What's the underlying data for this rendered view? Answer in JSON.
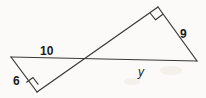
{
  "figure": {
    "type": "geometry-diagram",
    "background_color": "#fbfaf8",
    "stroke_color": "#3a3a3a",
    "text_color": "#1b1b1b",
    "canvas": {
      "width": 206,
      "height": 98
    },
    "points": {
      "left_apex": {
        "x": 11,
        "y": 57
      },
      "left_right_angle": {
        "x": 37,
        "y": 92
      },
      "crossing": {
        "x": 88,
        "y": 60
      },
      "top_right_angle": {
        "x": 158,
        "y": 7
      },
      "right_vertex": {
        "x": 197,
        "y": 61
      }
    },
    "segments": [
      {
        "name": "horizontal-base",
        "from": "left_apex",
        "to": "right_vertex"
      },
      {
        "name": "diagonal-hypotenuse",
        "from": "left_right_angle",
        "to": "top_right_angle"
      },
      {
        "name": "left-leg-6",
        "from": "left_apex",
        "to": "left_right_angle"
      },
      {
        "name": "right-leg-9",
        "from": "top_right_angle",
        "to": "right_vertex"
      }
    ],
    "right_angle_markers": [
      {
        "name": "left-triangle-right-angle",
        "at": "left_right_angle"
      },
      {
        "name": "right-triangle-right-angle",
        "at": "top_right_angle"
      }
    ],
    "labels": {
      "top_side": "10",
      "left_side": "6",
      "right_side": "9",
      "unknown_side": "y"
    }
  }
}
